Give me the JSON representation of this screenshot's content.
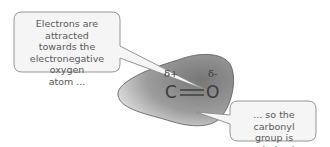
{
  "callouts": {
    "left": {
      "lines": [
        "Electrons are attracted",
        "towards the",
        "electronegative oxygen",
        "atom ..."
      ]
    },
    "right": {
      "lines": [
        "... so the carbonyl",
        "group is polarized."
      ]
    }
  },
  "molecule": {
    "atom_c": "C",
    "atom_o": "O",
    "charge_c": "δ+",
    "charge_o": "δ-",
    "bond": "double"
  },
  "colors": {
    "blob_light": "#e8e8e8",
    "blob_dark": "#7d7d7d",
    "callout_fill": "#f4f4f4",
    "callout_stroke": "#8a8a8a"
  }
}
